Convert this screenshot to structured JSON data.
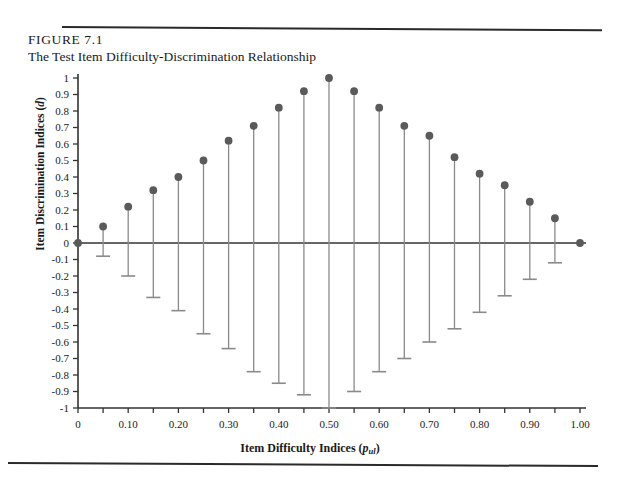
{
  "figure": {
    "number": "FIGURE 7.1",
    "title": "The Test Item Difficulty-Discrimination Relationship"
  },
  "axis_titles": {
    "y_prefix": "Item Discrimination Indices (",
    "y_italic": "d",
    "y_suffix": ")",
    "x_prefix": "Item Difficulty Indices (",
    "x_italic": "p",
    "x_subscript": "ul",
    "x_suffix": ")"
  },
  "chart_data": {
    "type": "scatter",
    "title": "The Test Item Difficulty-Discrimination Relationship",
    "xlabel": "Item Difficulty Indices (p_ul)",
    "ylabel": "Item Discrimination Indices (d)",
    "xlim": [
      0,
      1.0
    ],
    "ylim": [
      -1.0,
      1.0
    ],
    "grid": false,
    "legend": null,
    "x_tick_step": 0.05,
    "x_tick_labels": [
      "0",
      "0.10",
      "0.20",
      "0.30",
      "0.40",
      "0.50",
      "0.60",
      "0.70",
      "0.80",
      "0.90",
      "1.00"
    ],
    "x_tick_label_values": [
      0,
      0.1,
      0.2,
      0.3,
      0.4,
      0.5,
      0.6,
      0.7,
      0.8,
      0.9,
      1.0
    ],
    "y_tick_labels": [
      "1",
      "0.9",
      "0.8",
      "0.7",
      "0.6",
      "0.5",
      "0.4",
      "0.3",
      "0.2",
      "0.1",
      "0",
      "-0.1",
      "-0.2",
      "-0.3",
      "-0.4",
      "-0.5",
      "-0.6",
      "-0.7",
      "-0.8",
      "-0.9",
      "-1"
    ],
    "y_tick_values": [
      1,
      0.9,
      0.8,
      0.7,
      0.6,
      0.5,
      0.4,
      0.3,
      0.2,
      0.1,
      0,
      -0.1,
      -0.2,
      -0.3,
      -0.4,
      -0.5,
      -0.6,
      -0.7,
      -0.8,
      -0.9,
      -1
    ],
    "zero_line": 0,
    "marker_color": "#5a5a5a",
    "stem_color": "#8a8a8a",
    "axis_color": "#333333",
    "x": [
      0,
      0.05,
      0.1,
      0.15,
      0.2,
      0.25,
      0.3,
      0.35,
      0.4,
      0.45,
      0.5,
      0.55,
      0.6,
      0.65,
      0.7,
      0.75,
      0.8,
      0.85,
      0.9,
      0.95,
      1.0
    ],
    "series": [
      {
        "name": "Maximum discrimination (upper bound)",
        "values": [
          0,
          0.1,
          0.22,
          0.32,
          0.4,
          0.5,
          0.62,
          0.71,
          0.82,
          0.92,
          1.0,
          0.92,
          0.82,
          0.71,
          0.65,
          0.52,
          0.42,
          0.35,
          0.25,
          0.15,
          0
        ]
      },
      {
        "name": "Minimum discrimination (lower bound)",
        "values": [
          0,
          -0.08,
          -0.2,
          -0.33,
          -0.41,
          -0.55,
          -0.64,
          -0.78,
          -0.85,
          -0.92,
          -1.0,
          -0.9,
          -0.78,
          -0.7,
          -0.6,
          -0.52,
          -0.42,
          -0.32,
          -0.22,
          -0.12,
          0
        ]
      }
    ]
  }
}
